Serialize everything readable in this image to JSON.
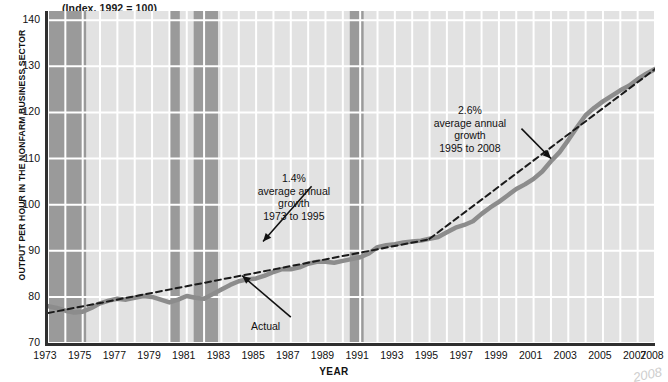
{
  "figure": {
    "index_note": "(Index, 1992 = 100)",
    "y_axis_title": "OUTPUT PER HOUR IN THE NONFARM BUSINESS SECTOR",
    "x_axis_title": "YEAR",
    "corner_scribble": "2008"
  },
  "colors": {
    "plot_background": "#e2e2e2",
    "gridline": "#ffffff",
    "recession_band": "#9a9a9a",
    "actual_line": "#8c8c8c",
    "trend_line": "#1a1a1a",
    "axis": "#2f2f2f",
    "text": "#111111"
  },
  "annotations": [
    {
      "name": "growth-1973-1995",
      "lines": [
        "1.4%",
        "average annual",
        "growth",
        "1973 to 1995"
      ],
      "x_pct": 41.0,
      "y_px": 172
    },
    {
      "name": "growth-1995-2008",
      "lines": [
        "2.6%",
        "average annual",
        "growth",
        "1995 to 2008"
      ],
      "x_pct": 70.0,
      "y_px": 104
    }
  ],
  "actual_label": {
    "text": "Actual",
    "x_px": 251,
    "y_px": 320
  },
  "chart_data": {
    "type": "line",
    "title": "",
    "subtitle": "(Index, 1992 = 100)",
    "xlabel": "YEAR",
    "ylabel": "OUTPUT PER HOUR IN THE NONFARM BUSINESS SECTOR",
    "xlim": [
      1973,
      2008
    ],
    "ylim": [
      70,
      142
    ],
    "yticks": [
      70,
      80,
      90,
      100,
      110,
      120,
      130,
      140
    ],
    "xticks": [
      1973,
      1975,
      1977,
      1979,
      1981,
      1983,
      1985,
      1987,
      1989,
      1991,
      1993,
      1995,
      1997,
      1999,
      2001,
      2003,
      2005,
      2007,
      2008
    ],
    "grid": true,
    "legend": false,
    "series": [
      {
        "name": "Actual",
        "type": "line",
        "color": "#8c8c8c",
        "x": [
          1973,
          1973.5,
          1974,
          1974.5,
          1975,
          1975.5,
          1976,
          1976.5,
          1977,
          1977.5,
          1978,
          1978.5,
          1979,
          1979.5,
          1980,
          1980.5,
          1981,
          1981.5,
          1982,
          1982.5,
          1983,
          1983.5,
          1984,
          1984.5,
          1985,
          1985.5,
          1986,
          1986.5,
          1987,
          1987.5,
          1988,
          1988.5,
          1989,
          1989.5,
          1990,
          1990.5,
          1991,
          1991.5,
          1992,
          1992.5,
          1993,
          1993.5,
          1994,
          1994.5,
          1995,
          1995.5,
          1996,
          1996.5,
          1997,
          1997.5,
          1998,
          1998.5,
          1999,
          1999.5,
          2000,
          2000.5,
          2001,
          2001.5,
          2002,
          2002.5,
          2003,
          2003.5,
          2004,
          2004.5,
          2005,
          2005.5,
          2006,
          2006.5,
          2007,
          2007.5,
          2008
        ],
        "y": [
          78.0,
          77.6,
          77.0,
          76.6,
          76.8,
          77.6,
          78.6,
          79.2,
          79.6,
          79.4,
          79.8,
          80.2,
          80.0,
          79.4,
          78.8,
          79.4,
          80.2,
          79.8,
          79.6,
          80.6,
          81.6,
          82.6,
          83.4,
          83.8,
          84.0,
          84.6,
          85.4,
          86.0,
          86.0,
          86.4,
          87.2,
          87.6,
          87.6,
          87.4,
          87.8,
          88.2,
          88.6,
          89.4,
          90.8,
          91.2,
          91.4,
          91.8,
          92.0,
          92.2,
          92.6,
          93.0,
          94.0,
          95.0,
          95.6,
          96.4,
          98.0,
          99.4,
          100.6,
          102.0,
          103.4,
          104.4,
          105.6,
          107.2,
          109.4,
          111.4,
          114.0,
          116.8,
          119.4,
          121.0,
          122.4,
          123.6,
          124.8,
          125.8,
          127.2,
          128.4,
          129.4
        ]
      },
      {
        "name": "1.4% average annual growth trend 1973 to 1995",
        "type": "trendline",
        "style": "dashed",
        "color": "#1a1a1a",
        "x": [
          1973,
          1995
        ],
        "y": [
          76.5,
          92.5
        ]
      },
      {
        "name": "2.6% average annual growth trend 1995 to 2008",
        "type": "trendline",
        "style": "dashed",
        "color": "#1a1a1a",
        "x": [
          1995,
          2008
        ],
        "y": [
          92.6,
          129.4
        ]
      }
    ],
    "shaded_regions": [
      {
        "name": "recession-1973-1975",
        "start": 1973.0,
        "end": 1975.2,
        "color": "#9a9a9a"
      },
      {
        "name": "recession-1980",
        "start": 1980.0,
        "end": 1980.6,
        "color": "#9a9a9a"
      },
      {
        "name": "recession-1981-1982",
        "start": 1981.4,
        "end": 1982.8,
        "color": "#9a9a9a"
      },
      {
        "name": "recession-1990-1991",
        "start": 1990.4,
        "end": 1991.2,
        "color": "#9a9a9a"
      }
    ],
    "annotations": [
      {
        "text": "1.4% average annual growth 1973 to 1995",
        "points_to": [
          1985.5,
          90.5
        ]
      },
      {
        "text": "2.6% average annual growth 1995 to 2008",
        "points_to": [
          2000.5,
          107.0
        ]
      },
      {
        "text": "Actual",
        "points_to": [
          1984.0,
          83.4
        ]
      }
    ]
  }
}
